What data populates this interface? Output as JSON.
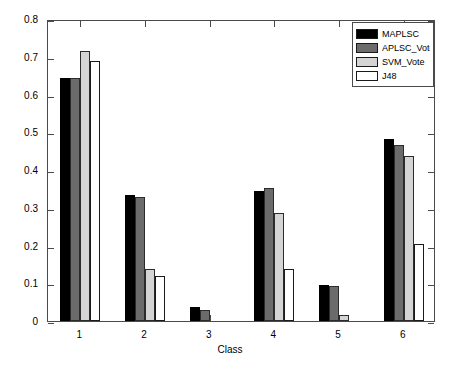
{
  "chart_data": {
    "type": "bar",
    "title": "",
    "xlabel": "Class",
    "ylabel": "",
    "categories": [
      "1",
      "2",
      "3",
      "4",
      "5",
      "6"
    ],
    "ylim": [
      0,
      0.8
    ],
    "yticks": [
      "0",
      "0.1",
      "0.2",
      "0.3",
      "0.4",
      "0.5",
      "0.6",
      "0.7",
      "0.8"
    ],
    "ytick_values": [
      0,
      0.1,
      0.2,
      0.3,
      0.4,
      0.5,
      0.6,
      0.7,
      0.8
    ],
    "grid": false,
    "legend_position": "upper right",
    "series": [
      {
        "name": "MAPLSC",
        "color": "#000000",
        "values": [
          0.645,
          0.335,
          0.037,
          0.345,
          0.095,
          0.481
        ]
      },
      {
        "name": "APLSC_Vote",
        "color": "#6b6b6b",
        "values": [
          0.643,
          0.328,
          0.03,
          0.352,
          0.092,
          0.465
        ]
      },
      {
        "name": "SVM_Vote",
        "color": "#d4d4d4",
        "values": [
          0.714,
          0.137,
          0.0,
          0.287,
          0.015,
          0.437
        ]
      },
      {
        "name": "J48",
        "color": "#ffffff",
        "values": [
          0.688,
          0.12,
          0.0,
          0.137,
          0.0,
          0.205
        ]
      }
    ]
  },
  "legend": {
    "items": [
      {
        "label": "MAPLSC"
      },
      {
        "label": "APLSC_Vote"
      },
      {
        "label": "SVM_Vote"
      },
      {
        "label": "J48"
      }
    ]
  },
  "axes": {
    "x_title": "Class"
  }
}
